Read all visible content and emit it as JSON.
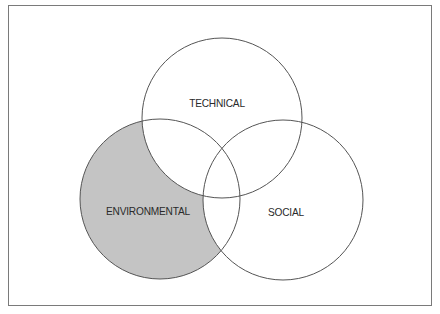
{
  "diagram": {
    "type": "venn",
    "sets": [
      {
        "id": "technical",
        "label": "TECHNICAL",
        "cx": 222,
        "cy": 118,
        "r": 80,
        "shaded": false
      },
      {
        "id": "environmental",
        "label": "ENVIRONMENTAL",
        "cx": 160,
        "cy": 199,
        "r": 80,
        "shaded": true
      },
      {
        "id": "social",
        "label": "SOCIAL",
        "cx": 283,
        "cy": 200,
        "r": 80,
        "shaded": false
      }
    ],
    "highlighted_region": "environmental-only",
    "colors": {
      "shade": "#c4c4c4",
      "stroke": "#555555",
      "frame": "#7a7a7a",
      "text": "#2a2a2a"
    }
  },
  "labels": {
    "technical": "TECHNICAL",
    "environmental": "ENVIRONMENTAL",
    "social": "SOCIAL"
  }
}
